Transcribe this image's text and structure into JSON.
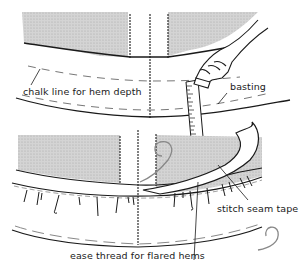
{
  "figure": {
    "colors": {
      "ink": "#1a1a1a",
      "shading": "#c8c8c8",
      "thread": "#8a8a8a",
      "background": "#ffffff"
    },
    "labels": {
      "chalk_line": "chalk line for hem depth",
      "basting": "basting",
      "stitch_seam_tape": "stitch seam tape",
      "ease_thread": "ease thread for flared hems"
    },
    "panels": [
      {
        "name": "top-panel",
        "content": "skirt hem marked with chalk line and basting, hand holding chalk against ruler"
      },
      {
        "name": "bottom-panel",
        "content": "seam tape being stitched over eased hem edge with ease thread"
      }
    ]
  }
}
